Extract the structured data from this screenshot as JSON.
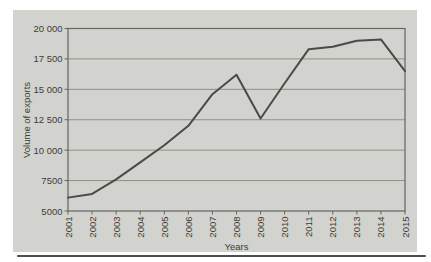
{
  "chart_data": {
    "type": "line",
    "title": "",
    "xlabel": "Years",
    "ylabel": "Volume of exports",
    "categories": [
      "2001",
      "2002",
      "2003",
      "2004",
      "2005",
      "2006",
      "2007",
      "2008",
      "2009",
      "2010",
      "2011",
      "2012",
      "2013",
      "2014",
      "2015"
    ],
    "series": [
      {
        "name": "Volume of exports",
        "values": [
          6100,
          6400,
          7600,
          9000,
          10400,
          12000,
          14600,
          16200,
          12600,
          15500,
          18300,
          18500,
          19000,
          19100,
          16500
        ]
      }
    ],
    "ylim": [
      5000,
      20000
    ],
    "ytick_interval": 2500,
    "ytick_labels": [
      "5000",
      "7500",
      "10 000",
      "12 500",
      "15 000",
      "17 500",
      "20 000"
    ],
    "grid": "horizontal",
    "legend": "none",
    "colors": {
      "plot_background": "#d2d3ce",
      "line": "#494b46",
      "gridline": "#8e908a",
      "axis": "#63655f",
      "text": "#3c3c3c",
      "bottom_rule": "#4d4f4b"
    }
  }
}
